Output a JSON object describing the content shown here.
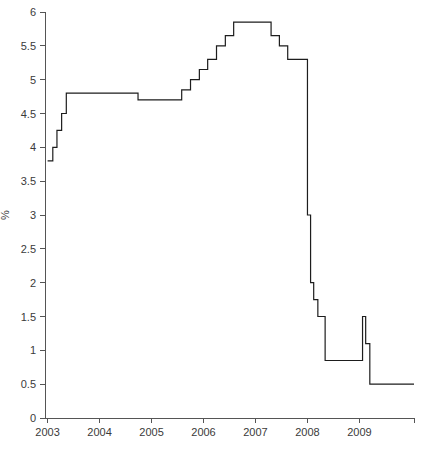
{
  "chart_data": {
    "type": "line",
    "variant": "step-post",
    "title": "",
    "subtitle": "",
    "xlabel": "",
    "ylabel": "%",
    "xlim": [
      2002.95,
      2010.05
    ],
    "ylim": [
      0,
      6
    ],
    "grid": false,
    "legend": null,
    "line_color": "#1d1d1d",
    "axis_color": "#555555",
    "ytick_labels": [
      "0",
      "0.5",
      "1",
      "1.5",
      "2",
      "2.5",
      "3",
      "3.5",
      "4",
      "4.5",
      "5",
      "5.5",
      "6"
    ],
    "ytick_values": [
      0,
      0.5,
      1,
      1.5,
      2,
      2.5,
      3,
      3.5,
      4,
      4.5,
      5,
      5.5,
      6
    ],
    "xtick_labels": [
      "2003",
      "2004",
      "2005",
      "2006",
      "2007",
      "2008",
      "2009"
    ],
    "xtick_values": [
      2003,
      2004,
      2005,
      2006,
      2007,
      2008,
      2009
    ],
    "series": [
      {
        "name": "policy rate",
        "x": [
          2003.0,
          2003.1,
          2003.18,
          2003.27,
          2003.36,
          2004.74,
          2005.58,
          2005.75,
          2005.92,
          2006.08,
          2006.25,
          2006.42,
          2006.58,
          2006.78,
          2007.3,
          2007.46,
          2007.62,
          2007.74,
          2008.0,
          2008.06,
          2008.12,
          2008.2,
          2008.34,
          2009.06,
          2009.12,
          2009.2,
          2010.0
        ],
        "values": [
          3.8,
          4.0,
          4.25,
          4.5,
          4.8,
          4.7,
          4.85,
          5.0,
          5.15,
          5.3,
          5.5,
          5.65,
          5.85,
          5.85,
          5.65,
          5.5,
          5.3,
          5.3,
          3.0,
          2.0,
          1.75,
          1.5,
          0.85,
          1.5,
          1.1,
          0.5,
          0.5
        ]
      }
    ],
    "annotations": []
  },
  "plot": {
    "margins": {
      "left": 45,
      "right": 8,
      "top": 12,
      "bottom": 34
    }
  }
}
